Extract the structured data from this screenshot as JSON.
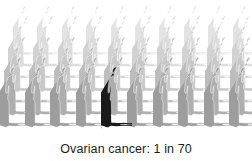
{
  "caption": {
    "text": "Ovarian cancer: 1 in 70",
    "condition": "Ovarian cancer",
    "ratio": "1 in 70",
    "numerator": 1,
    "denominator": 70
  },
  "visual": {
    "type": "pictogram",
    "icon_name": "female-body-silhouette",
    "total_figures": 70,
    "highlighted_figures": 1,
    "unhighlighted_figures": 69,
    "rows": 7,
    "figures_per_row": 10,
    "highlight_row_index": 6,
    "highlight_column_index": 4,
    "background_color": "#ffffff",
    "highlight_color": "#1a1a1a",
    "row_colors": [
      "#e3e3e3",
      "#dcdcdc",
      "#d2d2d2",
      "#c8c8c8",
      "#bdbdbd",
      "#aeaeae",
      "#9d9d9d"
    ],
    "perspective": "rows recede upward, each back row smaller and lighter"
  }
}
